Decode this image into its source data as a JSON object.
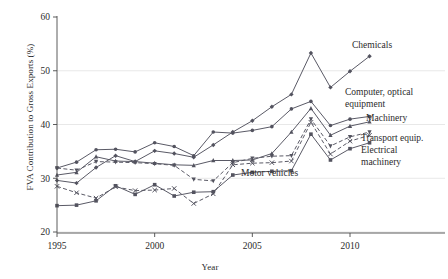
{
  "chart_data": {
    "type": "line",
    "title": "",
    "xlabel": "Year",
    "ylabel": "FVA Contribution to Gross Exports (%)",
    "xlim": [
      1994.4,
      2011.8
    ],
    "ylim": [
      18.5,
      62
    ],
    "xticks": [
      1995,
      2000,
      2005,
      2010
    ],
    "yticks": [
      20,
      30,
      40,
      50,
      60
    ],
    "grid": "horizontal",
    "legend": "inline-annotations",
    "x": [
      1995,
      1996,
      1997,
      1998,
      1999,
      2000,
      2001,
      2002,
      2003,
      2004,
      2005,
      2006,
      2007,
      2008,
      2009,
      2010,
      2011
    ],
    "series": [
      {
        "name": "Chemicals",
        "marker": "diamond",
        "style": "solid",
        "values": [
          29.6,
          29.1,
          32.0,
          34.2,
          33.1,
          35.1,
          34.6,
          33.9,
          36.2,
          38.6,
          40.7,
          43.3,
          45.6,
          53.3,
          46.9,
          49.9,
          52.7
        ]
      },
      {
        "name": "Computer, optical equipment",
        "marker": "circle",
        "style": "solid",
        "values": [
          31.9,
          33.0,
          35.3,
          35.4,
          34.9,
          36.6,
          35.9,
          34.2,
          38.6,
          38.4,
          38.9,
          39.6,
          42.9,
          44.3,
          39.8,
          41.0,
          41.5
        ]
      },
      {
        "name": "Machinery",
        "marker": "triangle",
        "style": "solid",
        "values": [
          30.6,
          31.1,
          34.0,
          33.2,
          33.1,
          32.8,
          32.5,
          32.4,
          33.3,
          33.3,
          33.4,
          34.6,
          38.6,
          43.0,
          38.0,
          39.7,
          40.5
        ]
      },
      {
        "name": "Transport equip.",
        "marker": "triangle-down",
        "style": "dashed",
        "values": [
          31.9,
          31.5,
          33.1,
          33.0,
          32.9,
          32.7,
          32.4,
          29.8,
          29.5,
          32.9,
          33.7,
          34.1,
          34.2,
          41.0,
          36.0,
          37.7,
          38.6
        ]
      },
      {
        "name": "Electrical machinery",
        "marker": "x",
        "style": "dashed",
        "values": [
          28.5,
          27.3,
          26.3,
          28.4,
          27.7,
          27.8,
          28.1,
          25.3,
          27.1,
          32.5,
          32.8,
          32.9,
          33.2,
          40.4,
          34.5,
          36.9,
          38.0
        ]
      },
      {
        "name": "Motor vehicles",
        "marker": "square",
        "style": "solid",
        "values": [
          24.9,
          25.0,
          25.8,
          28.6,
          27.0,
          28.8,
          26.7,
          27.4,
          27.5,
          30.6,
          31.1,
          31.3,
          31.4,
          38.2,
          33.4,
          35.5,
          36.6
        ]
      }
    ],
    "annotations": [
      {
        "label": "Chemicals",
        "x": 352,
        "y": 48
      },
      {
        "label": "Computer, optical",
        "x": 345,
        "y": 95
      },
      {
        "label": "equipment",
        "x": 345,
        "y": 107
      },
      {
        "label": "Machinery",
        "x": 366,
        "y": 121
      },
      {
        "label": "Transport equip.",
        "x": 361,
        "y": 141
      },
      {
        "label": "Electrical",
        "x": 361,
        "y": 153
      },
      {
        "label": "machinery",
        "x": 361,
        "y": 165
      },
      {
        "label": "Motor vehicles",
        "x": 241,
        "y": 176
      }
    ],
    "colors": {
      "line": "#5a5a66",
      "marker": "#53535f",
      "grid": "#e2e2e2",
      "axis": "#4a4a4a",
      "text": "#2b2b2b"
    }
  }
}
